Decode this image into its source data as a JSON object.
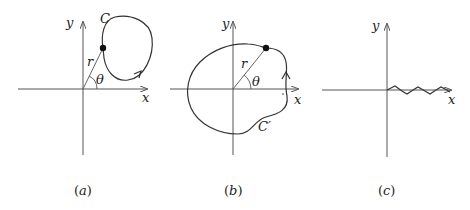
{
  "panels": [
    {
      "id": "a",
      "caption_open": "(",
      "caption_letter": "a",
      "caption_close": ")",
      "x_label": "x",
      "y_label": "y",
      "curve_label": "C",
      "radius_label": "r",
      "angle_label": "θ"
    },
    {
      "id": "b",
      "caption_open": "(",
      "caption_letter": "b",
      "caption_close": ")",
      "x_label": "x",
      "y_label": "y",
      "curve_label": "C′",
      "radius_label": "r",
      "angle_label": "θ"
    },
    {
      "id": "c",
      "caption_open": "(",
      "caption_letter": "c",
      "caption_close": ")",
      "x_label": "x",
      "y_label": "y"
    }
  ]
}
